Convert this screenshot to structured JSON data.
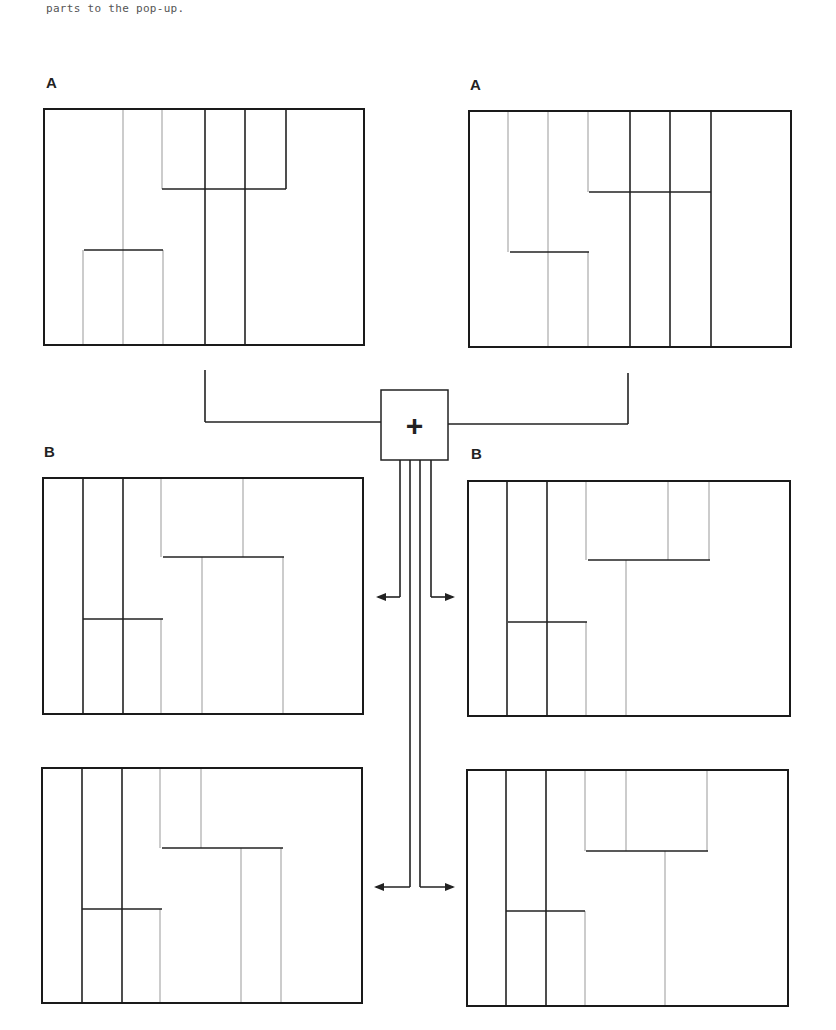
{
  "caption": "parts to the pop-up.",
  "colors": {
    "dark": "#222222",
    "gray": "#aaaaaa",
    "frame": "#1a1a1a"
  },
  "plus_symbol": "+",
  "labels": [
    {
      "text": "A",
      "x": 46,
      "y": 84
    },
    {
      "text": "A",
      "x": 470,
      "y": 86
    },
    {
      "text": "B",
      "x": 44,
      "y": 453
    },
    {
      "text": "B",
      "x": 471,
      "y": 455
    }
  ],
  "panels": [
    {
      "id": "A-left",
      "box": [
        44,
        109,
        364,
        345
      ],
      "dark": [
        [
          205,
          109,
          205,
          345
        ],
        [
          245,
          109,
          245,
          345
        ],
        [
          286,
          109,
          286,
          189
        ],
        [
          162,
          189,
          286,
          189
        ],
        [
          84,
          250,
          163,
          250
        ]
      ],
      "gray": [
        [
          123,
          109,
          123,
          345
        ],
        [
          162,
          109,
          162,
          189
        ],
        [
          83,
          250,
          83,
          345
        ],
        [
          163,
          250,
          163,
          345
        ]
      ]
    },
    {
      "id": "A-right",
      "box": [
        469,
        111,
        791,
        347
      ],
      "dark": [
        [
          630,
          111,
          630,
          347
        ],
        [
          670,
          111,
          670,
          347
        ],
        [
          711,
          111,
          711,
          347
        ],
        [
          589,
          192,
          711,
          192
        ],
        [
          510,
          252,
          589,
          252
        ]
      ],
      "gray": [
        [
          508,
          111,
          508,
          252
        ],
        [
          548,
          111,
          548,
          347
        ],
        [
          588,
          111,
          588,
          192
        ],
        [
          588,
          252,
          588,
          347
        ]
      ]
    },
    {
      "id": "B-left",
      "box": [
        43,
        478,
        363,
        714
      ],
      "dark": [
        [
          83,
          478,
          83,
          714
        ],
        [
          123,
          478,
          123,
          714
        ],
        [
          163,
          557,
          284,
          557
        ],
        [
          83,
          619,
          163,
          619
        ]
      ],
      "gray": [
        [
          161,
          478,
          161,
          557
        ],
        [
          243,
          478,
          243,
          557
        ],
        [
          161,
          619,
          161,
          714
        ],
        [
          202,
          557,
          202,
          714
        ],
        [
          283,
          557,
          283,
          714
        ]
      ]
    },
    {
      "id": "B-right",
      "box": [
        468,
        481,
        790,
        716
      ],
      "dark": [
        [
          507,
          481,
          507,
          716
        ],
        [
          547,
          481,
          547,
          716
        ],
        [
          588,
          560,
          710,
          560
        ],
        [
          508,
          622,
          587,
          622
        ]
      ],
      "gray": [
        [
          586,
          481,
          586,
          560
        ],
        [
          668,
          481,
          668,
          560
        ],
        [
          709,
          481,
          709,
          560
        ],
        [
          586,
          622,
          586,
          716
        ],
        [
          626,
          560,
          626,
          716
        ]
      ]
    },
    {
      "id": "C-left",
      "box": [
        42,
        768,
        362,
        1003
      ],
      "dark": [
        [
          82,
          768,
          82,
          1003
        ],
        [
          122,
          768,
          122,
          1003
        ],
        [
          162,
          848,
          283,
          848
        ],
        [
          82,
          909,
          162,
          909
        ]
      ],
      "gray": [
        [
          160,
          768,
          160,
          848
        ],
        [
          201,
          768,
          201,
          848
        ],
        [
          160,
          909,
          160,
          1003
        ],
        [
          241,
          848,
          241,
          1003
        ],
        [
          281,
          848,
          281,
          1003
        ]
      ]
    },
    {
      "id": "C-right",
      "box": [
        467,
        770,
        788,
        1006
      ],
      "dark": [
        [
          506,
          770,
          506,
          1006
        ],
        [
          546,
          770,
          546,
          1006
        ],
        [
          586,
          851,
          708,
          851
        ],
        [
          506,
          911,
          585,
          911
        ]
      ],
      "gray": [
        [
          585,
          770,
          585,
          851
        ],
        [
          626,
          770,
          626,
          851
        ],
        [
          707,
          770,
          707,
          851
        ],
        [
          585,
          911,
          585,
          1006
        ],
        [
          665,
          851,
          665,
          1006
        ]
      ]
    }
  ],
  "connector": {
    "plus_box": [
      381,
      390,
      448,
      460
    ],
    "lines": [
      [
        205,
        370,
        205,
        422
      ],
      [
        205,
        422,
        381,
        422
      ],
      [
        448,
        424,
        628,
        424
      ],
      [
        628,
        373,
        628,
        424
      ],
      [
        400,
        460,
        400,
        597
      ],
      [
        431,
        460,
        431,
        597
      ],
      [
        410,
        460,
        410,
        887
      ],
      [
        420,
        460,
        420,
        887
      ]
    ],
    "arrows": [
      [
        400,
        597,
        378,
        597
      ],
      [
        431,
        597,
        453,
        597
      ],
      [
        410,
        887,
        376,
        887
      ],
      [
        420,
        887,
        453,
        887
      ]
    ]
  }
}
